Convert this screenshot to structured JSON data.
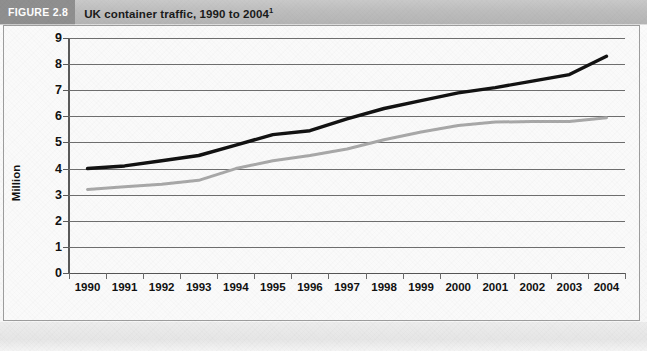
{
  "figure": {
    "tag": "FIGURE 2.8",
    "title_main": "UK container traffic, 1990 to 2004",
    "title_footnote_marker": "1"
  },
  "colors": {
    "band": "#bdbdbd",
    "tag_block": "#8f8f8f",
    "tag_text": "#ffffff",
    "title_text": "#1a1a1a",
    "gridline": "#6e6e6e",
    "axis": "#5a5a5a",
    "series_black": "#121212",
    "series_grey": "#a8a8a8",
    "plot_background": "#fafafa"
  },
  "chart_data": {
    "type": "line",
    "title": "UK container traffic, 1990 to 2004",
    "xlabel": "",
    "ylabel": "Million",
    "categories": [
      "1990",
      "1991",
      "1992",
      "1993",
      "1994",
      "1995",
      "1996",
      "1997",
      "1998",
      "1999",
      "2000",
      "2001",
      "2002",
      "2003",
      "2004"
    ],
    "ylim": [
      0,
      9
    ],
    "ytick_values": [
      0,
      1,
      2,
      3,
      4,
      5,
      6,
      7,
      8,
      9
    ],
    "ytick_labels": [
      "0",
      "1",
      "2",
      "3",
      "4",
      "5",
      "6",
      "7",
      "8",
      "9"
    ],
    "grid": true,
    "legend": "none",
    "series": [
      {
        "name": "series-black",
        "color": "#121212",
        "values": [
          4.0,
          4.1,
          4.3,
          4.5,
          4.9,
          5.3,
          5.45,
          5.9,
          6.3,
          6.6,
          6.9,
          7.1,
          7.35,
          7.6,
          8.3
        ]
      },
      {
        "name": "series-grey",
        "color": "#a8a8a8",
        "values": [
          3.2,
          3.3,
          3.4,
          3.55,
          4.0,
          4.3,
          4.5,
          4.75,
          5.1,
          5.4,
          5.65,
          5.78,
          5.8,
          5.8,
          5.95
        ]
      }
    ]
  }
}
